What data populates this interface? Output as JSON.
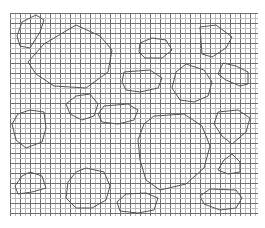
{
  "figure": {
    "grid": {
      "x0": 10,
      "y0": 13,
      "x1": 258,
      "y1": 216,
      "cell": 5,
      "major_every": 2,
      "minor_color": "#bdbdbd",
      "major_color": "#6e6e6e"
    },
    "outline_color": "#555555",
    "shapes": [
      {
        "id": "s1",
        "points": [
          [
            22,
            22
          ],
          [
            36,
            15
          ],
          [
            44,
            20
          ],
          [
            40,
            32
          ],
          [
            30,
            48
          ],
          [
            20,
            46
          ],
          [
            17,
            36
          ]
        ]
      },
      {
        "id": "s2",
        "points": [
          [
            76,
            25
          ],
          [
            100,
            36
          ],
          [
            112,
            50
          ],
          [
            108,
            72
          ],
          [
            86,
            88
          ],
          [
            54,
            86
          ],
          [
            36,
            74
          ],
          [
            28,
            62
          ],
          [
            44,
            44
          ]
        ]
      },
      {
        "id": "s3",
        "points": [
          [
            140,
            43
          ],
          [
            152,
            38
          ],
          [
            166,
            40
          ],
          [
            172,
            50
          ],
          [
            162,
            58
          ],
          [
            145,
            58
          ],
          [
            139,
            52
          ]
        ]
      },
      {
        "id": "s4",
        "points": [
          [
            200,
            27
          ],
          [
            216,
            25
          ],
          [
            232,
            37
          ],
          [
            226,
            48
          ],
          [
            212,
            57
          ],
          [
            202,
            54
          ]
        ]
      },
      {
        "id": "s5",
        "points": [
          [
            223,
            63
          ],
          [
            236,
            66
          ],
          [
            248,
            72
          ],
          [
            248,
            84
          ],
          [
            240,
            86
          ],
          [
            226,
            80
          ],
          [
            218,
            74
          ]
        ]
      },
      {
        "id": "s6",
        "points": [
          [
            124,
            72
          ],
          [
            150,
            70
          ],
          [
            162,
            78
          ],
          [
            158,
            88
          ],
          [
            140,
            92
          ],
          [
            126,
            90
          ],
          [
            122,
            82
          ]
        ]
      },
      {
        "id": "s7",
        "points": [
          [
            186,
            64
          ],
          [
            204,
            70
          ],
          [
            212,
            82
          ],
          [
            208,
            96
          ],
          [
            194,
            102
          ],
          [
            180,
            100
          ],
          [
            172,
            88
          ],
          [
            176,
            72
          ]
        ]
      },
      {
        "id": "s8",
        "points": [
          [
            30,
            110
          ],
          [
            44,
            112
          ],
          [
            46,
            128
          ],
          [
            42,
            142
          ],
          [
            26,
            148
          ],
          [
            16,
            140
          ],
          [
            12,
            124
          ],
          [
            18,
            114
          ]
        ]
      },
      {
        "id": "s9",
        "points": [
          [
            76,
            96
          ],
          [
            90,
            94
          ],
          [
            98,
            104
          ],
          [
            94,
            116
          ],
          [
            82,
            120
          ],
          [
            70,
            114
          ],
          [
            66,
            104
          ]
        ]
      },
      {
        "id": "s10",
        "points": [
          [
            104,
            106
          ],
          [
            128,
            104
          ],
          [
            138,
            110
          ],
          [
            134,
            120
          ],
          [
            118,
            124
          ],
          [
            102,
            122
          ],
          [
            98,
            114
          ]
        ]
      },
      {
        "id": "s11",
        "points": [
          [
            154,
            116
          ],
          [
            184,
            114
          ],
          [
            202,
            126
          ],
          [
            210,
            146
          ],
          [
            204,
            168
          ],
          [
            186,
            184
          ],
          [
            160,
            190
          ],
          [
            146,
            180
          ],
          [
            140,
            160
          ],
          [
            138,
            140
          ],
          [
            144,
            124
          ]
        ]
      },
      {
        "id": "s12",
        "points": [
          [
            218,
            112
          ],
          [
            238,
            110
          ],
          [
            250,
            118
          ],
          [
            246,
            132
          ],
          [
            232,
            144
          ],
          [
            222,
            136
          ],
          [
            214,
            124
          ]
        ]
      },
      {
        "id": "s13",
        "points": [
          [
            30,
            172
          ],
          [
            42,
            176
          ],
          [
            46,
            188
          ],
          [
            32,
            192
          ],
          [
            18,
            194
          ],
          [
            15,
            186
          ],
          [
            22,
            176
          ]
        ]
      },
      {
        "id": "s14",
        "points": [
          [
            86,
            168
          ],
          [
            104,
            172
          ],
          [
            110,
            186
          ],
          [
            106,
            200
          ],
          [
            92,
            208
          ],
          [
            76,
            208
          ],
          [
            66,
            198
          ],
          [
            68,
            182
          ],
          [
            76,
            172
          ]
        ]
      },
      {
        "id": "s15",
        "points": [
          [
            232,
            154
          ],
          [
            240,
            162
          ],
          [
            240,
            172
          ],
          [
            228,
            174
          ],
          [
            218,
            170
          ],
          [
            224,
            160
          ]
        ]
      },
      {
        "id": "s16",
        "points": [
          [
            126,
            194
          ],
          [
            146,
            193
          ],
          [
            158,
            198
          ],
          [
            154,
            210
          ],
          [
            138,
            213
          ],
          [
            120,
            211
          ],
          [
            117,
            202
          ]
        ]
      },
      {
        "id": "s17",
        "points": [
          [
            210,
            189
          ],
          [
            236,
            190
          ],
          [
            242,
            198
          ],
          [
            236,
            208
          ],
          [
            220,
            210
          ],
          [
            204,
            204
          ],
          [
            200,
            196
          ]
        ]
      }
    ]
  }
}
